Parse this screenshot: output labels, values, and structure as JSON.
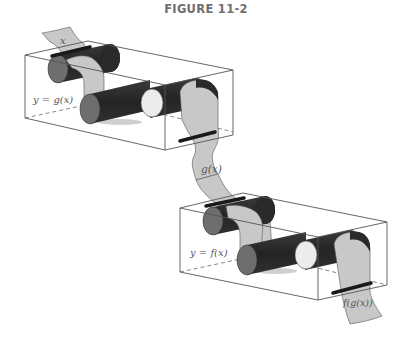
{
  "figure": {
    "title": "FIGURE 11-2"
  },
  "diagram": {
    "type": "function-composition-machines",
    "machines": [
      {
        "id": "g",
        "label": "y = g(x)",
        "input": "x",
        "output": "g(x)"
      },
      {
        "id": "f",
        "label": "y = f(x)",
        "input": "g(x)",
        "output": "f(g(x))"
      }
    ],
    "tape_labels": {
      "input": "x",
      "middle": "g(x)",
      "output": "f(g(x))"
    }
  },
  "colors": {
    "tape": "#c8c8c8",
    "roller_dark": "#2e2e2e",
    "roller_end": "#6e6e6e",
    "roller_light": "#ececec",
    "box_line": "#555555",
    "title": "#6f6f6f"
  }
}
